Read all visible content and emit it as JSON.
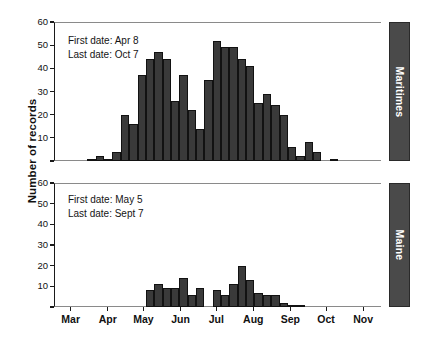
{
  "chart_data": {
    "type": "bar",
    "title": "",
    "xlabel": "",
    "ylabel": "Number of records",
    "ylim": [
      0,
      60
    ],
    "yticks": [
      0,
      10,
      20,
      30,
      40,
      50,
      60
    ],
    "grid": false,
    "legend_position": "right-tab",
    "xticks": [
      "Mar",
      "Apr",
      "May",
      "Jun",
      "Jul",
      "Aug",
      "Sep",
      "Oct",
      "Nov"
    ],
    "xtick_positions_day_of_year": [
      60,
      91,
      121,
      152,
      182,
      213,
      244,
      274,
      305
    ],
    "x_axis_range_day_of_year": [
      46,
      320
    ],
    "bin_width_days": 7,
    "panels": [
      {
        "name": "Maritimes",
        "side_label": "Maritimes",
        "annotation": {
          "first_date_label": "First date: Apr 8",
          "last_date_label": "Last date: Oct 7"
        },
        "bin_starts_day_of_year": [
          74,
          81,
          88,
          95,
          102,
          109,
          116,
          123,
          130,
          137,
          144,
          151,
          158,
          165,
          172,
          179,
          186,
          193,
          200,
          207,
          214,
          221,
          228,
          235,
          242,
          249,
          256,
          263,
          270,
          277,
          284,
          291,
          298
        ],
        "values": [
          1,
          2,
          1,
          4,
          20,
          16,
          37,
          44,
          47,
          44,
          26,
          37,
          22,
          14,
          35,
          52,
          49,
          49,
          44,
          41,
          25,
          29,
          24,
          20,
          6,
          2,
          8,
          4,
          0,
          1,
          0,
          0,
          0
        ]
      },
      {
        "name": "Maine",
        "side_label": "Maine",
        "annotation": {
          "first_date_label": "First date: May 5",
          "last_date_label": "Last date: Sept 7"
        },
        "bin_starts_day_of_year": [
          123,
          130,
          137,
          144,
          151,
          158,
          165,
          172,
          179,
          186,
          193,
          200,
          207,
          214,
          221,
          228,
          235,
          242,
          249,
          256
        ],
        "values": [
          8,
          11,
          9,
          9,
          14,
          6,
          9,
          0,
          8,
          6,
          11,
          20,
          13,
          7,
          6,
          6,
          2,
          1,
          1,
          0
        ]
      }
    ]
  }
}
